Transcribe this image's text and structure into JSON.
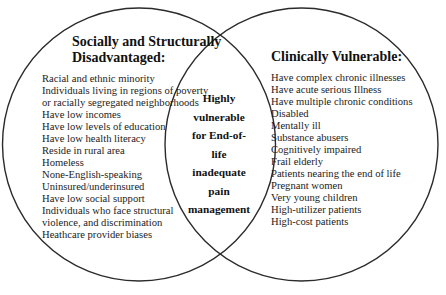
{
  "diagram": {
    "type": "venn",
    "left_set": {
      "title_lines": [
        "Socially and Structurally",
        "Disadvantaged:"
      ],
      "items": [
        "Racial and ethnic minority",
        "Individuals living in regions of poverty",
        "or racially segregated neighborhoods",
        "Have low incomes",
        "Have low levels of education",
        "Have low health literacy",
        "Reside in rural area",
        "Homeless",
        "None-English-speaking",
        "Uninsured/underinsured",
        "Have low social support",
        "Individuals who face structural",
        "violence, and discrimination",
        "Heathcare provider biases"
      ]
    },
    "right_set": {
      "title_lines": [
        "Clinically Vulnerable:"
      ],
      "items": [
        "Have complex chronic illnesses",
        "Have acute serious Illness",
        "Have multiple chronic conditions",
        "Disabled",
        "Mentally ill",
        "Substance abusers",
        "Cognitively impaired",
        "Frail elderly",
        "Patients nearing the end of life",
        "Pregnant women",
        "Very young children",
        "High-utilizer patients",
        "High-cost patients"
      ]
    },
    "intersection": {
      "lines": [
        "Highly",
        "vulnerable",
        "for End-of-",
        "life",
        "inadequate",
        "pain",
        "management"
      ]
    },
    "colors": {
      "stroke": "#2b2b2b",
      "background": "#ffffff"
    }
  }
}
